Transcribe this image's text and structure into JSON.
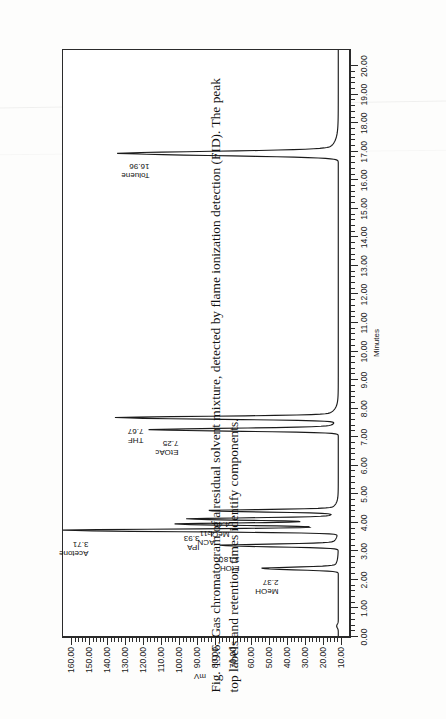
{
  "figure": {
    "caption_line1": "Fig. 19.6. Gas chromatogram of a residual solvent mixture, detected by flame ionization detection (FID). The peak",
    "caption_line2": "top labels and retention times identify components."
  },
  "chart_data": {
    "type": "line",
    "title": "",
    "xlabel": "Minutes",
    "ylabel": "mV",
    "xlim": [
      0.0,
      20.6
    ],
    "ylim": [
      5.0,
      165.0
    ],
    "grid": false,
    "legend": "none",
    "x_ticks": [
      "0.00",
      "1.00",
      "2.00",
      "3.00",
      "4.00",
      "5.00",
      "6.00",
      "7.00",
      "8.00",
      "9.00",
      "10.00",
      "11.00",
      "12.00",
      "13.00",
      "14.00",
      "15.00",
      "16.00",
      "17.00",
      "18.00",
      "19.00",
      "20.00"
    ],
    "x_tick_values": [
      0,
      1,
      2,
      3,
      4,
      5,
      6,
      7,
      8,
      9,
      10,
      11,
      12,
      13,
      14,
      15,
      16,
      17,
      18,
      19,
      20
    ],
    "y_ticks": [
      "160.00",
      "150.00",
      "140.00",
      "130.00",
      "120.00",
      "110.00",
      "100.00",
      "90.00",
      "80.00",
      "70.00",
      "60.00",
      "50.00",
      "40.00",
      "30.00",
      "20.00",
      "10.00"
    ],
    "y_tick_values": [
      160,
      150,
      140,
      130,
      120,
      110,
      100,
      90,
      80,
      70,
      60,
      50,
      40,
      30,
      20,
      10
    ],
    "baseline_mV": 11.0,
    "peaks": [
      {
        "name": "MeOH",
        "label": "MeOH",
        "rt": "2.37",
        "rt_value": 2.37,
        "height_mV": 52.0,
        "width_min": 0.1
      },
      {
        "name": "EtOH",
        "label": "EtOH",
        "rt": "3.18",
        "rt_value": 3.18,
        "height_mV": 74.0,
        "width_min": 0.1
      },
      {
        "name": "Acetone",
        "label": "Acetone",
        "rt": "3.71",
        "rt_value": 3.71,
        "height_mV": 158.0,
        "width_min": 0.1
      },
      {
        "name": "IPA",
        "label": "IPA",
        "rt": "3.93",
        "rt_value": 3.93,
        "height_mV": 96.0,
        "width_min": 0.09
      },
      {
        "name": "ACN",
        "label": "ACN",
        "rt": "4.11",
        "rt_value": 4.11,
        "height_mV": 88.0,
        "width_min": 0.09
      },
      {
        "name": "MeCl2",
        "label": "MeCl",
        "label_sub": "2",
        "rt": "4.40",
        "rt_value": 4.4,
        "height_mV": 80.0,
        "width_min": 0.09
      },
      {
        "name": "EtOAc",
        "label": "EtOAc",
        "rt": "7.25",
        "rt_value": 7.25,
        "height_mV": 108.0,
        "width_min": 0.11
      },
      {
        "name": "THF",
        "label": "THF",
        "rt": "7.67",
        "rt_value": 7.67,
        "height_mV": 127.0,
        "width_min": 0.11
      },
      {
        "name": "Toluene",
        "label": "Toluene",
        "rt": "16.96",
        "rt_value": 16.96,
        "height_mV": 124.0,
        "width_min": 0.16
      }
    ]
  }
}
